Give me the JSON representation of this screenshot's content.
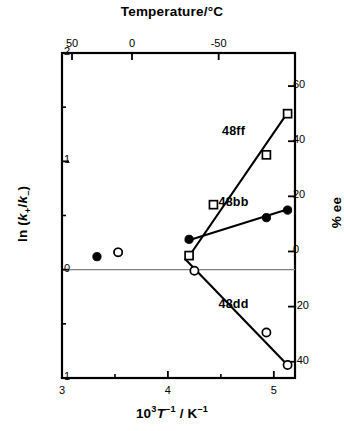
{
  "chart_data": {
    "type": "scatter",
    "title": "",
    "xlabel": "10^3 T^-1 / K^-1",
    "ylabel": "ln (k+/k-)",
    "y2label": "% ee",
    "top_axis_label": "Temperature/°C",
    "xlim": [
      3,
      5.2
    ],
    "ylim": [
      -1,
      2
    ],
    "y2lim": [
      -45.9,
      72.0
    ],
    "grid": false,
    "legend_position": "inline-labels",
    "xticks": [
      3,
      4,
      5
    ],
    "xticklabels": [
      "3",
      "4",
      "5"
    ],
    "xminorticks": [
      3.5,
      4.5
    ],
    "yticks": [
      -1,
      0,
      1,
      2
    ],
    "yticklabels": [
      "-1",
      "0",
      "1",
      "2"
    ],
    "yminorticks": [
      -0.5,
      0.5,
      1.5
    ],
    "y2ticks": [
      -40,
      -20,
      0,
      20,
      40,
      60
    ],
    "y2ticklabels": [
      "-40",
      "-20",
      "0",
      "20",
      "40",
      "60"
    ],
    "topticks": [
      3.0945,
      3.661,
      4.4793
    ],
    "topticklabels": [
      "50",
      "0",
      "-50"
    ],
    "zero_line": 0,
    "series": [
      {
        "name": "48ff",
        "marker": "open-square",
        "label_x": 4.62,
        "label_y": 1.27,
        "points": [
          {
            "x": 4.2,
            "y": 0.13
          },
          {
            "x": 4.43,
            "y": 0.6
          },
          {
            "x": 4.93,
            "y": 1.06
          },
          {
            "x": 5.13,
            "y": 1.44
          }
        ],
        "fit_line": {
          "x1": 4.19,
          "y1": 0.11,
          "x2": 5.13,
          "y2": 1.45
        }
      },
      {
        "name": "48bb",
        "marker": "filled-circle",
        "label_x": 4.62,
        "label_y": 0.62,
        "points": [
          {
            "x": 3.33,
            "y": 0.12
          },
          {
            "x": 3.53,
            "y": 0.16
          },
          {
            "x": 4.2,
            "y": 0.28
          },
          {
            "x": 4.93,
            "y": 0.48
          },
          {
            "x": 5.13,
            "y": 0.55
          }
        ],
        "fit_line": {
          "x1": 4.16,
          "y1": 0.26,
          "x2": 5.14,
          "y2": 0.56
        }
      },
      {
        "name": "48dd",
        "marker": "open-circle",
        "label_x": 4.62,
        "label_y": -0.33,
        "points": [
          {
            "x": 3.53,
            "y": 0.16
          },
          {
            "x": 4.25,
            "y": -0.01
          },
          {
            "x": 4.93,
            "y": -0.58
          },
          {
            "x": 5.13,
            "y": -0.88
          }
        ],
        "fit_line": {
          "x1": 4.16,
          "y1": 0.1,
          "x2": 5.15,
          "y2": -0.9
        }
      }
    ],
    "colors": {
      "ink": "#000000",
      "zero_line": "#808080"
    }
  }
}
